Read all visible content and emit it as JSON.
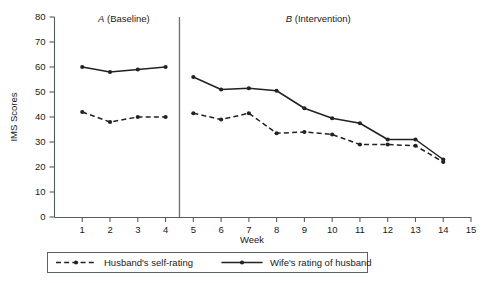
{
  "chart_data": {
    "type": "line",
    "title": "",
    "xlabel": "Week",
    "ylabel": "IMS Scores",
    "xlim": [
      0,
      15
    ],
    "ylim": [
      0,
      80
    ],
    "grid": false,
    "x": [
      1,
      2,
      3,
      4,
      5,
      6,
      7,
      8,
      9,
      10,
      11,
      12,
      13,
      14
    ],
    "xticks": [
      "1",
      "2",
      "3",
      "4",
      "5",
      "6",
      "7",
      "8",
      "9",
      "10",
      "11",
      "12",
      "13",
      "14",
      "15"
    ],
    "xtick_values": [
      1,
      2,
      3,
      4,
      5,
      6,
      7,
      8,
      9,
      10,
      11,
      12,
      13,
      14,
      15
    ],
    "yticks": [
      "0",
      "10",
      "20",
      "30",
      "40",
      "50",
      "60",
      "70",
      "80"
    ],
    "ytick_values": [
      0,
      10,
      20,
      30,
      40,
      50,
      60,
      70,
      80
    ],
    "series": [
      {
        "name": "Husband's self-rating",
        "style": "dashed",
        "marker": "circle",
        "color": "#1f2323",
        "values": [
          42,
          38,
          40,
          40,
          41.5,
          39,
          41.5,
          33.5,
          34,
          33,
          29,
          29,
          28.5,
          22
        ]
      },
      {
        "name": "Wife's rating of husband",
        "style": "solid",
        "marker": "circle",
        "color": "#1f2323",
        "values": [
          60,
          58,
          59,
          60,
          56,
          51,
          51.5,
          50.5,
          43.5,
          39.5,
          37.5,
          31,
          31,
          23
        ]
      }
    ],
    "annotations": [
      {
        "name": "phase-a-label",
        "italic_part": "A",
        "rest": " (Baseline)",
        "text": "A (Baseline)",
        "x_center": 2.5
      },
      {
        "name": "phase-b-label",
        "italic_part": "B",
        "rest": " (Intervention)",
        "text": "B (Intervention)",
        "x_center": 9.5
      }
    ],
    "phase_divider": {
      "name": "phase-divider",
      "x": 4.5
    },
    "legend": {
      "position": "bottom",
      "entries": [
        {
          "label": "Husband's self-rating",
          "style": "dashed"
        },
        {
          "label": "Wife's rating of husband",
          "style": "solid"
        }
      ]
    }
  }
}
